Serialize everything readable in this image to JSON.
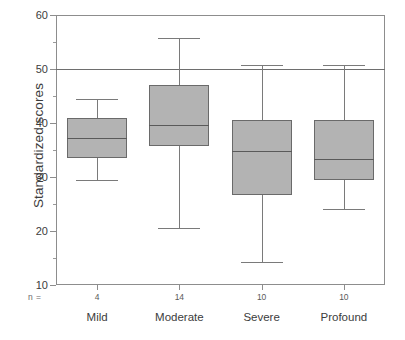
{
  "chart_data": {
    "type": "box",
    "title": "",
    "xlabel": "",
    "ylabel": "Standardized scores",
    "ylim": [
      10,
      60
    ],
    "ytick_labels": [
      "60",
      "50",
      "40",
      "30",
      "20",
      "10"
    ],
    "ytick_values": [
      60,
      50,
      40,
      30,
      20,
      10
    ],
    "yminor_values": [
      55,
      45,
      35,
      25,
      15
    ],
    "grid": false,
    "legend": "none",
    "reference_line": 50,
    "n_label": "n =",
    "categories": [
      "Mild",
      "Moderate",
      "Severe",
      "Profound"
    ],
    "counts": [
      4,
      14,
      10,
      10
    ],
    "boxes": [
      {
        "category": "Mild",
        "n": 4,
        "whisker_low": 29.4,
        "q1": 33.5,
        "median": 37.3,
        "q3": 41.0,
        "whisker_high": 44.5
      },
      {
        "category": "Moderate",
        "n": 14,
        "whisker_low": 20.5,
        "q1": 35.8,
        "median": 39.7,
        "q3": 47.0,
        "whisker_high": 55.8
      },
      {
        "category": "Severe",
        "n": 10,
        "whisker_low": 14.2,
        "q1": 26.7,
        "median": 34.8,
        "q3": 40.6,
        "whisker_high": 50.7
      },
      {
        "category": "Profound",
        "n": 10,
        "whisker_low": 24.0,
        "q1": 29.5,
        "median": 33.4,
        "q3": 40.6,
        "whisker_high": 50.7
      }
    ],
    "colors": {
      "box_fill": "#b3b3b3",
      "box_edge": "#6a6a6a",
      "median": "#5a5a5a",
      "whisker": "#7a7a7a",
      "axis": "#8d8d8d",
      "reference_line": "#6e6e6e",
      "text": "#3c3c3c",
      "background": "#ffffff"
    }
  }
}
